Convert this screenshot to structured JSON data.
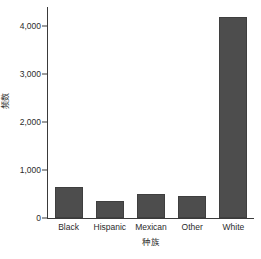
{
  "chart_data": {
    "type": "bar",
    "title": "",
    "subtitle": "",
    "xlabel": "种族",
    "ylabel": "频数",
    "categories": [
      "Black",
      "Hispanic",
      "Mexican",
      "Other",
      "White"
    ],
    "values": [
      650,
      360,
      510,
      450,
      4200
    ],
    "series": [
      {
        "name": "频数",
        "values": [
          650,
          360,
          510,
          450,
          4200
        ]
      }
    ],
    "ylim": [
      0,
      4400
    ],
    "xlim": [
      0,
      5
    ],
    "y_ticks": [
      0,
      1000,
      2000,
      3000,
      4000
    ],
    "y_tick_labels": [
      "0",
      "1,000",
      "2,000",
      "3,000",
      "4,000"
    ],
    "grid": false,
    "legend": false,
    "legend_position": "none",
    "bar_color": "#4d4d4d",
    "bar_edge_color": "#3f3f3f",
    "axis_color": "#3a3a3a",
    "text_color": "#2b2b2b",
    "background_color": "#ffffff"
  }
}
